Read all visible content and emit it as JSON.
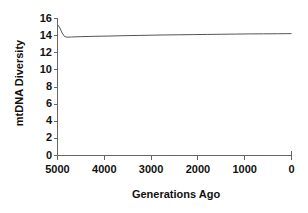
{
  "chart_data": {
    "type": "line",
    "title": "",
    "xlabel": "Generations Ago",
    "ylabel": "mtDNA Diversity",
    "xlim": [
      5000,
      0
    ],
    "ylim": [
      0,
      16
    ],
    "x_reversed": true,
    "grid": false,
    "legend": null,
    "xticks": [
      5000,
      4000,
      3000,
      2000,
      1000,
      0
    ],
    "xtick_labels": [
      "5000",
      "4000",
      "3000",
      "2000",
      "1000",
      "0"
    ],
    "yticks": [
      0,
      2,
      4,
      6,
      8,
      10,
      12,
      14,
      16
    ],
    "ytick_labels": [
      "0",
      "2",
      "4",
      "6",
      "8",
      "10",
      "12",
      "14",
      "16"
    ],
    "series": [
      {
        "name": "mtDNA Diversity",
        "color": "#555555",
        "x": [
          5000,
          4950,
          4900,
          4850,
          4800,
          4700,
          4500,
          4200,
          3900,
          3600,
          3300,
          3000,
          2700,
          2400,
          2100,
          1800,
          1500,
          1200,
          900,
          600,
          300,
          100,
          0
        ],
        "y": [
          15.3,
          14.9,
          14.3,
          13.9,
          13.82,
          13.84,
          13.88,
          13.92,
          13.95,
          13.99,
          14.02,
          14.05,
          14.08,
          14.1,
          14.12,
          14.14,
          14.16,
          14.18,
          14.2,
          14.21,
          14.22,
          14.23,
          14.24
        ]
      }
    ]
  },
  "axis_style": {
    "axis_color": "#666666",
    "tick_color": "#666666",
    "line_color": "#555555"
  }
}
